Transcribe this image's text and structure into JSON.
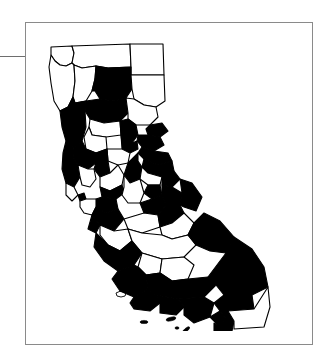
{
  "figure": {
    "frame": {
      "border_color": "#8a8a8a",
      "background_color": "#ffffff"
    },
    "left_rule": {
      "name": "horizontal-rule",
      "color": "#6e6e6e"
    }
  },
  "map": {
    "region_name": "California",
    "projection_note": "unlabeled plain outline",
    "colors": {
      "shaded_fill": "#000000",
      "unshaded_fill": "#ffffff",
      "boundary_stroke": "#000000"
    },
    "legend_present": false,
    "labels_present": false,
    "counts": {
      "shaded": 35,
      "unshaded": 23,
      "total": 58
    },
    "counties": [
      {
        "id": "del-norte",
        "name": "Del Norte",
        "shaded": false
      },
      {
        "id": "siskiyou",
        "name": "Siskiyou",
        "shaded": false
      },
      {
        "id": "modoc",
        "name": "Modoc",
        "shaded": false
      },
      {
        "id": "humboldt",
        "name": "Humboldt",
        "shaded": false
      },
      {
        "id": "trinity",
        "name": "Trinity",
        "shaded": false
      },
      {
        "id": "shasta",
        "name": "Shasta",
        "shaded": true
      },
      {
        "id": "lassen",
        "name": "Lassen",
        "shaded": false
      },
      {
        "id": "tehama",
        "name": "Tehama",
        "shaded": true
      },
      {
        "id": "plumas",
        "name": "Plumas",
        "shaded": false
      },
      {
        "id": "mendocino",
        "name": "Mendocino",
        "shaded": true
      },
      {
        "id": "glenn",
        "name": "Glenn",
        "shaded": false
      },
      {
        "id": "butte",
        "name": "Butte",
        "shaded": true
      },
      {
        "id": "sierra",
        "name": "Sierra",
        "shaded": true
      },
      {
        "id": "nevada",
        "name": "Nevada",
        "shaded": true
      },
      {
        "id": "colusa",
        "name": "Colusa",
        "shaded": false
      },
      {
        "id": "yuba",
        "name": "Yuba",
        "shaded": true
      },
      {
        "id": "placer",
        "name": "Placer",
        "shaded": true
      },
      {
        "id": "lake",
        "name": "Lake",
        "shaded": true
      },
      {
        "id": "sutter",
        "name": "Sutter",
        "shaded": false
      },
      {
        "id": "yolo",
        "name": "Yolo",
        "shaded": true
      },
      {
        "id": "el-dorado",
        "name": "El Dorado",
        "shaded": true
      },
      {
        "id": "sonoma",
        "name": "Sonoma",
        "shaded": true
      },
      {
        "id": "napa",
        "name": "Napa",
        "shaded": false
      },
      {
        "id": "sacramento",
        "name": "Sacramento",
        "shaded": true
      },
      {
        "id": "amador",
        "name": "Amador",
        "shaded": false
      },
      {
        "id": "alpine",
        "name": "Alpine",
        "shaded": true
      },
      {
        "id": "solano",
        "name": "Solano",
        "shaded": false
      },
      {
        "id": "calaveras",
        "name": "Calaveras",
        "shaded": true
      },
      {
        "id": "tuolumne",
        "name": "Tuolumne",
        "shaded": true
      },
      {
        "id": "mono",
        "name": "Mono",
        "shaded": true
      },
      {
        "id": "marin",
        "name": "Marin",
        "shaded": false
      },
      {
        "id": "contra-costa",
        "name": "Contra Costa",
        "shaded": true
      },
      {
        "id": "san-joaquin",
        "name": "San Joaquin",
        "shaded": false
      },
      {
        "id": "stanislaus",
        "name": "Stanislaus",
        "shaded": true
      },
      {
        "id": "san-francisco",
        "name": "San Francisco",
        "shaded": true
      },
      {
        "id": "alameda",
        "name": "Alameda",
        "shaded": true
      },
      {
        "id": "san-mateo",
        "name": "San Mateo",
        "shaded": false
      },
      {
        "id": "santa-clara",
        "name": "Santa Clara",
        "shaded": true
      },
      {
        "id": "merced",
        "name": "Merced",
        "shaded": false
      },
      {
        "id": "mariposa",
        "name": "Mariposa",
        "shaded": true
      },
      {
        "id": "madera",
        "name": "Madera",
        "shaded": false
      },
      {
        "id": "santa-cruz",
        "name": "Santa Cruz",
        "shaded": true
      },
      {
        "id": "san-benito",
        "name": "San Benito",
        "shaded": false
      },
      {
        "id": "fresno",
        "name": "Fresno",
        "shaded": false
      },
      {
        "id": "inyo",
        "name": "Inyo",
        "shaded": true
      },
      {
        "id": "monterey",
        "name": "Monterey",
        "shaded": true
      },
      {
        "id": "kings",
        "name": "Kings",
        "shaded": false
      },
      {
        "id": "tulare",
        "name": "Tulare",
        "shaded": false
      },
      {
        "id": "san-luis-obispo",
        "name": "San Luis Obispo",
        "shaded": true
      },
      {
        "id": "kern",
        "name": "Kern",
        "shaded": true
      },
      {
        "id": "san-bernardino",
        "name": "San Bernardino",
        "shaded": true
      },
      {
        "id": "santa-barbara",
        "name": "Santa Barbara",
        "shaded": true
      },
      {
        "id": "ventura",
        "name": "Ventura",
        "shaded": true
      },
      {
        "id": "los-angeles",
        "name": "Los Angeles",
        "shaded": true
      },
      {
        "id": "orange",
        "name": "Orange",
        "shaded": true
      },
      {
        "id": "riverside",
        "name": "Riverside",
        "shaded": true
      },
      {
        "id": "san-diego",
        "name": "San Diego",
        "shaded": true
      },
      {
        "id": "imperial",
        "name": "Imperial",
        "shaded": false
      }
    ],
    "islands": [
      {
        "id": "santa-cruz-island",
        "name": "Santa Cruz Island",
        "shaded": true
      },
      {
        "id": "santa-rosa-island",
        "name": "Santa Rosa Island",
        "shaded": true
      },
      {
        "id": "santa-catalina",
        "name": "Santa Catalina Island",
        "shaded": true
      },
      {
        "id": "san-clemente-island",
        "name": "San Clemente Island",
        "shaded": true
      }
    ]
  }
}
